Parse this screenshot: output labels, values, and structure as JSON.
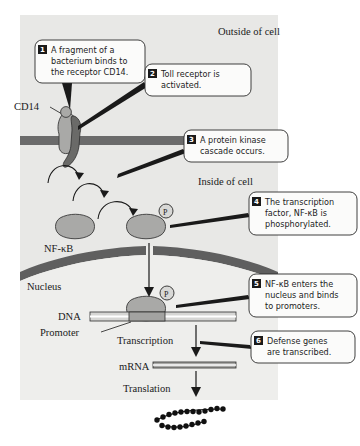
{
  "figure": {
    "regions": {
      "outside_label": "Outside of cell",
      "inside_label": "Inside of cell",
      "nucleus_label": "Nucleus"
    },
    "molecule_labels": {
      "cd14": "CD14",
      "nfkb": "NF-κB",
      "dna": "DNA",
      "promoter": "Promoter",
      "mrna": "mRNA",
      "phosphate": "P"
    },
    "process_labels": {
      "transcription": "Transcription",
      "translation": "Translation"
    },
    "callouts": [
      {
        "number": "1",
        "lines": [
          "A fragment of a",
          "bacterium binds to",
          "the receptor CD14."
        ]
      },
      {
        "number": "2",
        "lines": [
          "Toll receptor is",
          "activated."
        ]
      },
      {
        "number": "3",
        "lines": [
          "A protein kinase",
          "cascade occurs."
        ]
      },
      {
        "number": "4",
        "lines": [
          "The transcription",
          "factor, NF-κB is",
          "phosphorylated."
        ]
      },
      {
        "number": "5",
        "lines": [
          "NF-κB enters the",
          "nucleus and binds",
          "to promoters."
        ]
      },
      {
        "number": "6",
        "lines": [
          "Defense genes",
          "are transcribed."
        ]
      }
    ],
    "colors": {
      "page_background": "#ffffff",
      "cell_background": "#e8e8e6",
      "nucleus_background": "#eeeeec",
      "membrane": "#6b6b6b",
      "nuclear_envelope": "#5f5f5f",
      "protein_fill": "#a9a9a7",
      "toll_receptor": "#6a6a68",
      "callout_fill": "#fbfbfa",
      "ink": "#1a1a1a"
    }
  }
}
